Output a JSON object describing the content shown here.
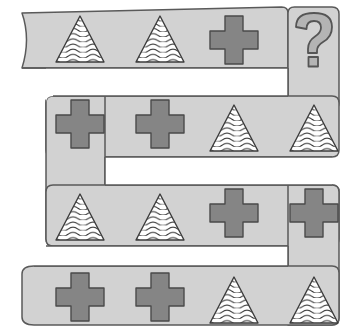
{
  "puzzle": {
    "title": "Shape sequence ribbon puzzle",
    "type": "visual-pattern-sequence",
    "shape_names": {
      "triangle": "wavy-filled-triangle",
      "cross": "filled-plus-cross",
      "question": "question-mark"
    },
    "colors": {
      "band_fill": "#d2d2d2",
      "band_stroke": "#5a5a5a",
      "cross_fill": "#858585",
      "cross_stroke": "#4a4a4a",
      "triangle_fill": "#ffffff",
      "triangle_stroke": "#3c3c3c",
      "wave_stroke": "#3c3c3c",
      "question_fill": "#b4b4b4",
      "question_stroke": "#555555",
      "page_background": "#ffffff"
    },
    "rows": [
      {
        "row_index": 1,
        "direction": "left-to-right",
        "left_end": "torn-concave",
        "right_end": "connects-down",
        "cells": [
          {
            "index": 1,
            "shape": "triangle",
            "label": "triangle"
          },
          {
            "index": 2,
            "shape": "triangle",
            "label": "triangle"
          },
          {
            "index": 3,
            "shape": "cross",
            "label": "cross"
          },
          {
            "index": 4,
            "shape": "question",
            "label": "?"
          }
        ]
      },
      {
        "row_index": 2,
        "direction": "right-to-left",
        "left_end": "connects-down",
        "right_end": "connects-up",
        "cells": [
          {
            "index": 1,
            "shape": "cross",
            "label": "cross"
          },
          {
            "index": 2,
            "shape": "cross",
            "label": "cross"
          },
          {
            "index": 3,
            "shape": "triangle",
            "label": "triangle"
          },
          {
            "index": 4,
            "shape": "triangle",
            "label": "triangle"
          }
        ]
      },
      {
        "row_index": 3,
        "direction": "left-to-right",
        "left_end": "connects-up",
        "right_end": "connects-down",
        "cells": [
          {
            "index": 1,
            "shape": "triangle",
            "label": "triangle"
          },
          {
            "index": 2,
            "shape": "triangle",
            "label": "triangle"
          },
          {
            "index": 3,
            "shape": "cross",
            "label": "cross"
          },
          {
            "index": 4,
            "shape": "cross",
            "label": "cross"
          }
        ]
      },
      {
        "row_index": 4,
        "direction": "right-to-left",
        "left_end": "rounded",
        "right_end": "connects-up",
        "cells": [
          {
            "index": 1,
            "shape": "cross",
            "label": "cross"
          },
          {
            "index": 2,
            "shape": "cross",
            "label": "cross"
          },
          {
            "index": 3,
            "shape": "triangle",
            "label": "triangle"
          },
          {
            "index": 4,
            "shape": "triangle",
            "label": "triangle"
          }
        ]
      }
    ],
    "question_mark": {
      "text": "?",
      "row": 1,
      "cell": 4
    }
  }
}
